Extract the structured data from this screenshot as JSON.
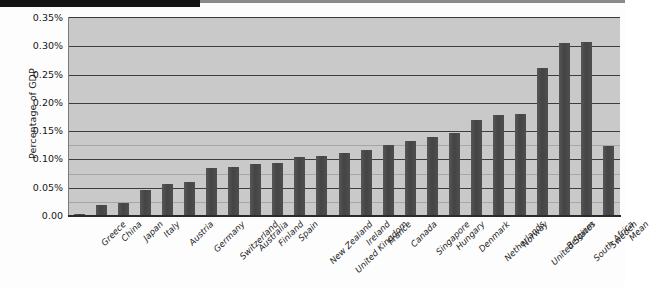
{
  "chart_data": {
    "type": "bar",
    "title": "",
    "subtitle": "",
    "xlabel": "",
    "ylabel": "Percentage of GDP",
    "ylim": [
      0,
      0.0035
    ],
    "y_tick_labels": [
      "0.35%",
      "0.30%",
      "0.25%",
      "0.20%",
      "0.15%",
      "0.10%",
      "0.05%",
      "0.00"
    ],
    "y_tick_values": [
      0.35,
      0.3,
      0.25,
      0.2,
      0.15,
      0.1,
      0.05,
      0.0
    ],
    "y_unit": "percent",
    "grid": true,
    "grid_axis": "y",
    "legend": false,
    "legend_position": "none",
    "orientation": "vertical",
    "categories": [
      "Greece",
      "China",
      "Japan",
      "Italy",
      "Austria",
      "Germany",
      "Switzerland",
      "Australia",
      "Finland",
      "Spain",
      "New Zealand",
      "United Kingdom",
      "Ireland",
      "France",
      "Canada",
      "Singapore",
      "Hungary",
      "Denmark",
      "Netherlands",
      "Norway",
      "United States",
      "Belgium",
      "South Africa",
      "Sweden",
      "Mean"
    ],
    "values": [
      0.004,
      0.019,
      0.023,
      0.046,
      0.057,
      0.06,
      0.085,
      0.086,
      0.092,
      0.093,
      0.104,
      0.106,
      0.112,
      0.117,
      0.125,
      0.133,
      0.14,
      0.146,
      0.169,
      0.178,
      0.18,
      0.262,
      0.305,
      0.308,
      0.124
    ],
    "bar_color": "#4b4b4b",
    "plot_background_color": "#c9c9c9",
    "figure_background_color": "#fdfdfd"
  }
}
